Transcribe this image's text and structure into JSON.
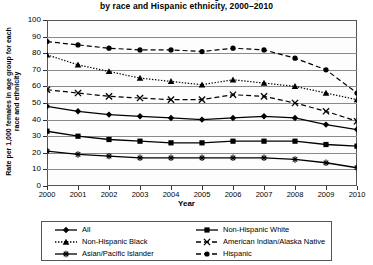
{
  "chart_data": {
    "type": "line",
    "title": "Birth rates for females aged 15–19,",
    "title_line1": "Birth rates for females aged 15–19,",
    "title_line2": "by race and Hispanic ethnicity, 2000–2010",
    "xlabel": "Year",
    "ylabel": "Rate per 1,000 females in age group for each race and ethnicity",
    "categories": [
      "2000",
      "2001",
      "2002",
      "2003",
      "2004",
      "2005",
      "2006",
      "2007",
      "2008",
      "2009",
      "2010"
    ],
    "x": [
      2000,
      2001,
      2002,
      2003,
      2004,
      2005,
      2006,
      2007,
      2008,
      2009,
      2010
    ],
    "ylim": [
      0,
      100
    ],
    "ytick_values": [
      0,
      10,
      20,
      30,
      40,
      50,
      60,
      70,
      80,
      90,
      100
    ],
    "ytick_labels": [
      "0",
      "10",
      "20",
      "30",
      "40",
      "50",
      "60",
      "70",
      "80",
      "90",
      "100"
    ],
    "grid": true,
    "legend_position": "bottom",
    "series": [
      {
        "name": "All",
        "marker": "diamond",
        "line_style": "solid",
        "color": "#000000",
        "values": [
          48,
          45,
          43,
          42,
          41,
          40,
          41,
          42,
          41,
          37,
          34
        ]
      },
      {
        "name": "Non-Hispanic White",
        "marker": "square",
        "line_style": "solid",
        "color": "#000000",
        "values": [
          33,
          30,
          28,
          27,
          26,
          26,
          27,
          27,
          27,
          25,
          24
        ]
      },
      {
        "name": "Non-Hispanic Black",
        "marker": "triangle",
        "line_style": "dotted",
        "color": "#000000",
        "values": [
          79,
          73,
          69,
          65,
          63,
          61,
          64,
          62,
          60,
          56,
          52
        ]
      },
      {
        "name": "American Indian/Alaska Native",
        "marker": "cross",
        "line_style": "dashed",
        "color": "#000000",
        "values": [
          58,
          56,
          54,
          53,
          52,
          52,
          55,
          54,
          50,
          45,
          39
        ]
      },
      {
        "name": "Asian/Pacific Islander",
        "marker": "asterisk",
        "line_style": "solid",
        "color": "#000000",
        "values": [
          21,
          19,
          18,
          17,
          17,
          17,
          17,
          17,
          16,
          14,
          11
        ]
      },
      {
        "name": "Hispanic",
        "marker": "circle",
        "line_style": "dashed",
        "color": "#000000",
        "values": [
          87,
          85,
          83,
          82,
          82,
          81,
          83,
          82,
          77,
          70,
          56
        ]
      }
    ]
  }
}
